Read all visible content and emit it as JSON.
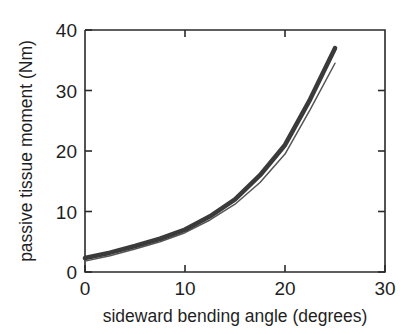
{
  "chart_data": {
    "type": "line",
    "title": "",
    "xlabel": "sideward bending angle (degrees)",
    "ylabel": "passive tissue moment (Nm)",
    "xlim": [
      0,
      30
    ],
    "ylim": [
      0,
      40
    ],
    "xticks": [
      0,
      10,
      20,
      30
    ],
    "yticks": [
      0,
      10,
      20,
      30,
      40
    ],
    "xtick_labels": [
      "0",
      "10",
      "20",
      "30"
    ],
    "ytick_labels": [
      "0",
      "10",
      "20",
      "30",
      "40"
    ],
    "grid": false,
    "legend": "none",
    "series": [
      {
        "name": "thick band",
        "style": "thick-line",
        "color": "#3a3a3a",
        "x": [
          0,
          2.5,
          5,
          7.5,
          10,
          12.5,
          15,
          17.5,
          20,
          22.5,
          25
        ],
        "values": [
          2.3,
          3.2,
          4.3,
          5.5,
          7.0,
          9.2,
          12.0,
          16.0,
          21.0,
          28.5,
          37.0
        ]
      },
      {
        "name": "thin line",
        "style": "thin-line",
        "color": "#555555",
        "x": [
          0,
          2.5,
          5,
          7.5,
          10,
          12.5,
          15,
          17.5,
          20,
          22.5,
          25
        ],
        "values": [
          1.8,
          2.7,
          3.8,
          5.0,
          6.5,
          8.6,
          11.2,
          14.8,
          19.5,
          26.8,
          34.5
        ]
      }
    ]
  },
  "axes": {
    "box_left": 85,
    "box_right": 385,
    "box_top": 30,
    "box_bottom": 272
  }
}
